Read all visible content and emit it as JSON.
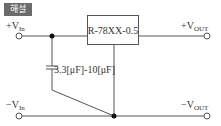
{
  "badge": {
    "label": "해설"
  },
  "terminals": {
    "vin_pos": {
      "sign": "+",
      "base": "V",
      "sub": "In"
    },
    "vin_neg": {
      "sign": "−",
      "base": "V",
      "sub": "In"
    },
    "vout_pos": {
      "sign": "+",
      "base": "V",
      "sub": "OUT"
    },
    "vout_neg": {
      "sign": "−",
      "base": "V",
      "sub": "OUT"
    }
  },
  "regulator": {
    "label": "R-78XX-0.5"
  },
  "capacitor": {
    "label": "3.3[μF]-10[μF]"
  },
  "colors": {
    "wire": "#555555",
    "badge_bg": "#6b6b6b",
    "text": "#333333"
  }
}
